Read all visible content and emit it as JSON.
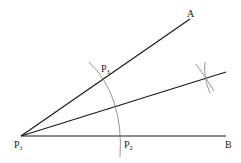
{
  "diagram": {
    "vertex": {
      "name": "P1",
      "x": 21,
      "y": 136
    },
    "rays": [
      {
        "name": "ray-p1-a",
        "x2": 190,
        "y2": 19,
        "end_label": "A"
      },
      {
        "name": "ray-p1-b",
        "x2": 226,
        "y2": 136,
        "end_label": "B"
      },
      {
        "name": "bisector",
        "x2": 226,
        "y2": 72,
        "end_label": ""
      }
    ],
    "points": [
      {
        "id": "A",
        "base": "A",
        "sub": ""
      },
      {
        "id": "B",
        "base": "B",
        "sub": ""
      },
      {
        "id": "P1",
        "base": "P",
        "sub": "1"
      },
      {
        "id": "P2",
        "base": "P",
        "sub": "2"
      },
      {
        "id": "P3",
        "base": "P",
        "sub": "3"
      }
    ],
    "labels": {
      "A": "A",
      "B": "B",
      "P1_base": "P",
      "P1_sub": "1",
      "P2_base": "P",
      "P2_sub": "2",
      "P3_base": "P",
      "P3_sub": "3"
    },
    "colors": {
      "line": "#1a1a1a",
      "arc": "#7a7a7a",
      "background": "#ffffff"
    }
  }
}
